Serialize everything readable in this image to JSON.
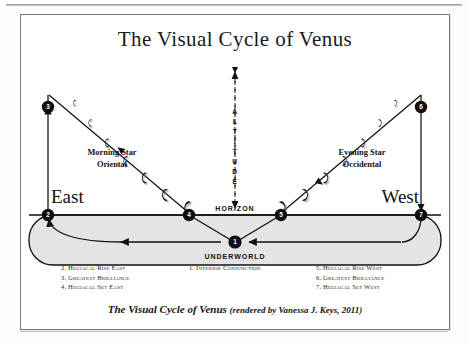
{
  "figure": {
    "title": "The Visual Cycle of Venus",
    "caption_title": "The Visual Cycle of Venus",
    "caption_credit": "(rendered by Vanessa J. Keys, 2011)"
  },
  "diagram": {
    "axis_label": "ALTITUDE",
    "horizon_label": "HORIZON",
    "underworld_label": "UNDERWORLD",
    "direction_east": "East",
    "direction_west": "West",
    "morning_star_line1": "Morning Star",
    "morning_star_line2": "Oriental",
    "evening_star_line1": "Evening Star",
    "evening_star_line2": "Occidental",
    "nodes": [
      {
        "id": "1",
        "label": "1"
      },
      {
        "id": "2",
        "label": "2"
      },
      {
        "id": "3",
        "label": "3"
      },
      {
        "id": "4",
        "label": "4"
      },
      {
        "id": "5",
        "label": "5"
      },
      {
        "id": "6",
        "label": "6"
      },
      {
        "id": "7",
        "label": "7"
      }
    ]
  },
  "legend": {
    "column_left": [
      "2. Heliacal Rise East",
      "3. Greatest Brilliance",
      "4. Heliacal Set East"
    ],
    "column_center": [
      "1. Interior Conjunction"
    ],
    "column_right": [
      "5. Heliacal Rise West",
      "6. Greatest Brilliance",
      "7. Heliacal Set West"
    ]
  },
  "colors": {
    "ink": "#111111",
    "border": "#7a7a7a",
    "underworld_fill": "#e3e3e3",
    "node_fill": "#0d0d0d"
  }
}
